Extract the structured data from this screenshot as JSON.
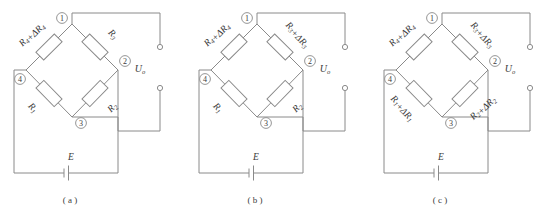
{
  "figure": {
    "line_color": "#8a8a8a",
    "text_color": "#3a3a3a",
    "background": "#ffffff"
  },
  "common": {
    "nodes": [
      "1",
      "2",
      "3",
      "4"
    ],
    "output_label": "U",
    "output_sub": "o",
    "source_label": "E"
  },
  "panels": [
    {
      "caption": "( a )",
      "resistors": {
        "top_left": {
          "base": "R",
          "base_sub": "4",
          "delta": "+ΔR",
          "delta_sub": "4",
          "full": "R4+ΔR4"
        },
        "top_right": {
          "base": "R",
          "base_sub": "3",
          "delta": "",
          "delta_sub": "",
          "full": "R3"
        },
        "bottom_left": {
          "base": "R",
          "base_sub": "1",
          "delta": "",
          "delta_sub": "",
          "full": "R1"
        },
        "bottom_right": {
          "base": "R",
          "base_sub": "2",
          "delta": "",
          "delta_sub": "",
          "full": "R2"
        }
      }
    },
    {
      "caption": "( b )",
      "resistors": {
        "top_left": {
          "base": "R",
          "base_sub": "4",
          "delta": "+ΔR",
          "delta_sub": "4",
          "full": "R4+ΔR4"
        },
        "top_right": {
          "base": "R",
          "base_sub": "3",
          "delta": "+ΔR",
          "delta_sub": "3",
          "full": "R3+ΔR3"
        },
        "bottom_left": {
          "base": "R",
          "base_sub": "1",
          "delta": "",
          "delta_sub": "",
          "full": "R1"
        },
        "bottom_right": {
          "base": "R",
          "base_sub": "2",
          "delta": "",
          "delta_sub": "",
          "full": "R2"
        }
      }
    },
    {
      "caption": "( c )",
      "resistors": {
        "top_left": {
          "base": "R",
          "base_sub": "4",
          "delta": "+ΔR",
          "delta_sub": "4",
          "full": "R4+ΔR4"
        },
        "top_right": {
          "base": "R",
          "base_sub": "3",
          "delta": "+ΔR",
          "delta_sub": "3",
          "full": "R3+ΔR3"
        },
        "bottom_left": {
          "base": "R",
          "base_sub": "1",
          "delta": "+ΔR",
          "delta_sub": "1",
          "full": "R1+ΔR1"
        },
        "bottom_right": {
          "base": "R",
          "base_sub": "2",
          "delta": "+ΔR",
          "delta_sub": "2",
          "full": "R2+ΔR2"
        }
      }
    }
  ]
}
